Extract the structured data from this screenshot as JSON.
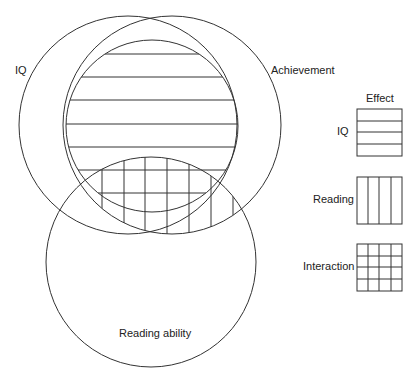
{
  "diagram": {
    "type": "venn",
    "circles": [
      {
        "label": "IQ"
      },
      {
        "label": "Achievement"
      },
      {
        "label": "Reading ability"
      }
    ],
    "legend": {
      "title": "Effect",
      "items": [
        {
          "label": "IQ",
          "pattern": "horizontal-lines"
        },
        {
          "label": "Reading",
          "pattern": "vertical-lines"
        },
        {
          "label": "Interaction",
          "pattern": "grid"
        }
      ]
    },
    "colors": {
      "stroke": "#333333",
      "background": "#ffffff"
    }
  }
}
